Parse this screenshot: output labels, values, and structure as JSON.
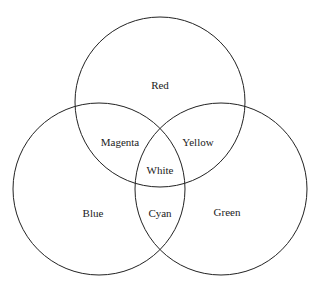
{
  "diagram": {
    "type": "venn",
    "circles": [
      {
        "id": "red",
        "label": "Red",
        "cx": 160,
        "cy": 102,
        "r": 85,
        "label_x": 160,
        "label_y": 89
      },
      {
        "id": "blue",
        "label": "Blue",
        "cx": 99,
        "cy": 189,
        "r": 86,
        "label_x": 93,
        "label_y": 217
      },
      {
        "id": "green",
        "label": "Green",
        "cx": 221,
        "cy": 189,
        "r": 86,
        "label_x": 227,
        "label_y": 216
      }
    ],
    "intersections": [
      {
        "id": "magenta",
        "label": "Magenta",
        "sets": [
          "red",
          "blue"
        ],
        "x": 120,
        "y": 146
      },
      {
        "id": "yellow",
        "label": "Yellow",
        "sets": [
          "red",
          "green"
        ],
        "x": 198,
        "y": 146
      },
      {
        "id": "cyan",
        "label": "Cyan",
        "sets": [
          "blue",
          "green"
        ],
        "x": 160,
        "y": 217
      },
      {
        "id": "white",
        "label": "White",
        "sets": [
          "red",
          "blue",
          "green"
        ],
        "x": 160,
        "y": 174
      }
    ],
    "stroke_color": "#222222"
  }
}
